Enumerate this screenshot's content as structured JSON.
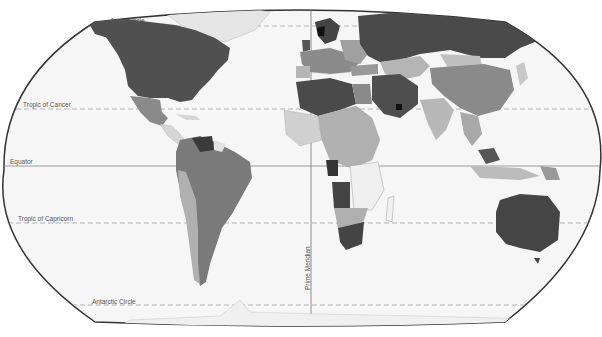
{
  "map": {
    "type": "choropleth world map",
    "projection": "pseudo-cylindrical (Eckert-style)",
    "palette": {
      "ocean": "#f4f4f4",
      "outline": "#333333",
      "very_dark": "#222222",
      "dark": "#555555",
      "medium": "#8a8a8a",
      "light": "#b5b5b5",
      "very_light": "#e2e2e2",
      "no_data": "#ffffff",
      "reference_line": "#888888"
    },
    "reference_lines": {
      "arctic_circle": "Arctic Circle",
      "tropic_of_cancer": "Tropic of Cancer",
      "equator": "Equator",
      "tropic_of_capricorn": "Tropic of Capricorn",
      "antarctic_circle": "Antarctic Circle",
      "prime_meridian": "Prime Meridian"
    }
  }
}
